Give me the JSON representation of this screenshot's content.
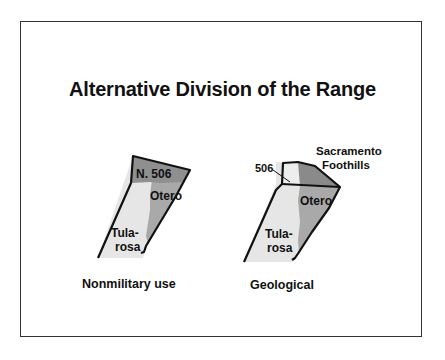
{
  "title": "Alternative Division of the Range",
  "maps": [
    {
      "caption": "Nonmilitary use",
      "regions": [
        {
          "name": "N. 506",
          "shade": "#8f8f8f"
        },
        {
          "name": "Otero",
          "shade": "#a9a9a9"
        },
        {
          "name_line1": "Tula-",
          "name_line2": "rosa",
          "shade": "#e6e6e6"
        }
      ]
    },
    {
      "caption": "Geological",
      "regions": [
        {
          "name": "506",
          "shade": "#ededed"
        },
        {
          "name_line1": "Sacramento",
          "name_line2": "Foothills",
          "shade": "#8a8a8a"
        },
        {
          "name": "Otero",
          "shade": "#a9a9a9"
        },
        {
          "name_line1": "Tula-",
          "name_line2": "rosa",
          "shade": "#e6e6e6"
        }
      ]
    }
  ]
}
